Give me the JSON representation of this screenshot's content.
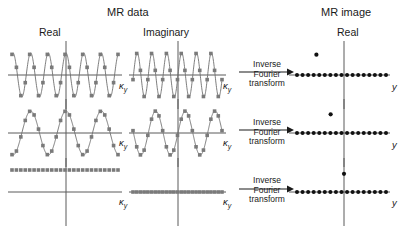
{
  "figure": {
    "headers": {
      "mr_data": "MR data",
      "mr_image": "MR image",
      "real": "Real",
      "imaginary": "Imaginary",
      "image_real": "Real"
    },
    "axis_labels": {
      "k_space": "κ",
      "k_space_sub": "y",
      "image_axis": "y"
    },
    "transform_label": {
      "line1": "Inverse",
      "line2": "Fourier",
      "line3": "transform"
    },
    "colors": {
      "data_curve": "#6e6e6e",
      "data_marker": "#7a7a7a",
      "axis": "#5a5a5a",
      "image_dot": "#111111",
      "text": "#1a1a1a",
      "background": "#ffffff"
    }
  },
  "chart_data": {
    "type": "line",
    "title": "MR data",
    "xlabel": "κy",
    "ylabel": "",
    "rows": [
      {
        "row": 1,
        "real": {
          "waveform": "cosine",
          "cycles": 6,
          "amplitude": 1,
          "n_samples": 25,
          "phase": "cosine (peak at center)"
        },
        "imaginary": {
          "waveform": "sine",
          "cycles": 6,
          "amplitude": 1,
          "n_samples": 25,
          "phase": "sine (zero at center)"
        },
        "image": {
          "baseline_dots": 17,
          "offset_dot": {
            "x_norm": -0.62,
            "y_norm": 0.78
          },
          "note": "high frequency gives dot far from center"
        }
      },
      {
        "row": 2,
        "real": {
          "waveform": "cosine",
          "cycles": 3,
          "amplitude": 1,
          "n_samples": 25,
          "phase": "cosine (peak at center)"
        },
        "imaginary": {
          "waveform": "sine",
          "cycles": 3,
          "amplitude": 1,
          "n_samples": 25,
          "phase": "sine (zero at center)"
        },
        "image": {
          "baseline_dots": 17,
          "offset_dot": {
            "x_norm": -0.3,
            "y_norm": 0.72
          },
          "note": "mid frequency gives dot nearer center"
        }
      },
      {
        "row": 3,
        "real": {
          "waveform": "constant",
          "cycles": 0,
          "amplitude": 1,
          "n_samples": 25,
          "phase": "DC level above axis"
        },
        "imaginary": {
          "waveform": "constant",
          "cycles": 0,
          "amplitude": 0,
          "n_samples": 25,
          "phase": "zero on axis"
        },
        "image": {
          "baseline_dots": 17,
          "offset_dot": {
            "x_norm": 0.0,
            "y_norm": 0.7
          },
          "note": "zero frequency gives dot on the center axis"
        }
      }
    ],
    "legend": [],
    "grid": false
  }
}
